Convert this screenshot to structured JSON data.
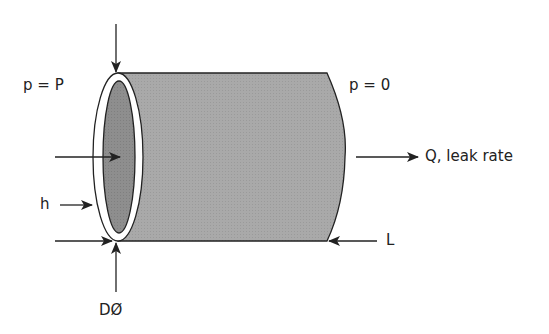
{
  "diagram": {
    "labels": {
      "inlet_pressure": "p = P",
      "outlet_pressure": "p = 0",
      "leak_rate": "Q, leak rate",
      "gap_height": "h",
      "length": "L",
      "diameter": "DØ"
    },
    "colors": {
      "body_fill": "#a8a8a8",
      "inner_fill": "#8c8c8c",
      "ring_fill": "#ffffff",
      "stroke": "#222222",
      "background": "#ffffff"
    }
  }
}
